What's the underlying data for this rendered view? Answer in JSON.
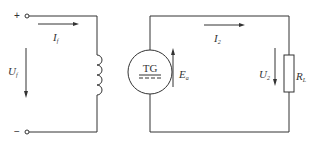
{
  "diagram": {
    "left_circuit": {
      "terminal_plus": "+",
      "terminal_minus": "−",
      "current_label": {
        "main": "I",
        "sub": "f"
      },
      "voltage_label": {
        "main": "U",
        "sub": "f"
      },
      "component": "inductor (field winding)"
    },
    "right_circuit": {
      "generator_label": "TG",
      "emf_label": {
        "main": "E",
        "sub": "a"
      },
      "current_label": {
        "main": "I",
        "sub": "2"
      },
      "voltage_label": {
        "main": "U",
        "sub": "2"
      },
      "resistor_label": {
        "main": "R",
        "sub": "L"
      }
    },
    "colors": {
      "line": "#333333",
      "background": "#ffffff"
    }
  }
}
